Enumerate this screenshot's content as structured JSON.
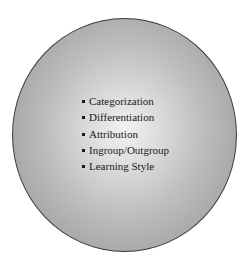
{
  "diagram": {
    "shape": "circle",
    "fill_center": "#f2f2f2",
    "fill_edge": "#969696",
    "items": [
      {
        "label": "Categorization"
      },
      {
        "label": "Differentiation"
      },
      {
        "label": "Attribution"
      },
      {
        "label": "Ingroup/Outgroup"
      },
      {
        "label": "Learning Style"
      }
    ]
  }
}
